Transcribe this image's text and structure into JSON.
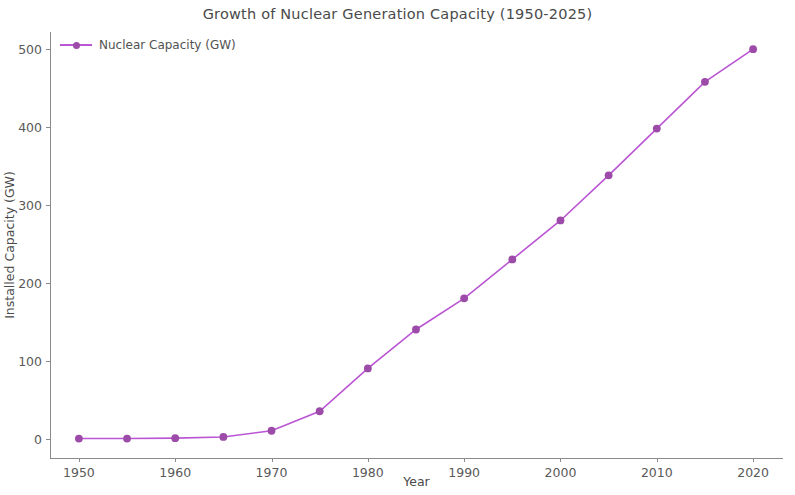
{
  "chart_data": {
    "type": "line",
    "title": "Growth of Nuclear Generation Capacity (1950-2025)",
    "xlabel": "Year",
    "ylabel": "Installed Capacity (GW)",
    "legend_position": "upper left",
    "grid": false,
    "line_color": "#ba55d3",
    "marker_color": "#9c4ba8",
    "x": [
      1950,
      1955,
      1960,
      1965,
      1970,
      1975,
      1980,
      1985,
      1990,
      1995,
      2000,
      2005,
      2010,
      2015,
      2020
    ],
    "series": [
      {
        "name": "Nuclear Capacity (GW)",
        "values": [
          0,
          0,
          0.5,
          2,
          10,
          35,
          90,
          140,
          180,
          230,
          280,
          338,
          398,
          458,
          500
        ]
      }
    ],
    "xlim": [
      1947,
      2023
    ],
    "ylim": [
      -25,
      522
    ],
    "xticks": [
      1950,
      1960,
      1970,
      1980,
      1990,
      2000,
      2010,
      2020
    ],
    "xtick_labels": [
      "1950",
      "1960",
      "1970",
      "1980",
      "1990",
      "2000",
      "2010",
      "2020"
    ],
    "yticks": [
      0,
      100,
      200,
      300,
      400,
      500
    ],
    "ytick_labels": [
      "0",
      "100",
      "200",
      "300",
      "400",
      "500"
    ]
  }
}
